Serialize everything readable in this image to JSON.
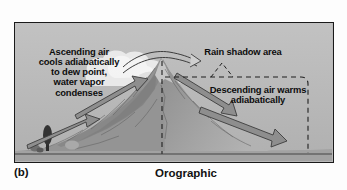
{
  "figure": {
    "panel_letter": "(b)",
    "caption": "Orographic",
    "diagram_type": "orographic precipitation cross-section",
    "background_color": "#b9b9b9",
    "border_color": "#1a1a1a"
  },
  "labels": {
    "ascending": "Ascending air\ncools adiabatically\nto dew point,\nwater vapor\ncondenses",
    "rain_shadow": "Rain shadow area",
    "descending": "Descending air warms\nadiabatically"
  },
  "elements": {
    "mountain_name": "mountain-cross-section",
    "cloud_name": "cloud",
    "tree_name": "tree",
    "bush_name": "bush",
    "windward_arrow_lower": "ascending-air-arrow-lower",
    "windward_arrow_upper": "ascending-air-arrow-upper",
    "summit_arrow": "summit-airflow-arrow",
    "leeward_arrow_upper": "descending-air-arrow-upper",
    "leeward_arrow_lower": "descending-air-arrow-lower",
    "peak_dashed_line": "summit-vertical-dashed-line",
    "rain_shadow_boundary": "rain-shadow-dashed-boundary",
    "rain_shadow_leader": "rain-shadow-leader-line",
    "ground_line": "ground-line"
  },
  "colors": {
    "sky": "#b9b9b9",
    "mountain_light": "#bdbdbd",
    "mountain_mid": "#9a9a9a",
    "mountain_dark": "#848484",
    "arrow_fill": "#8c8c8c",
    "arrow_stroke": "#3b3b3b",
    "cloud": "#ececec",
    "outline": "#1a1a1a",
    "text": "#0d0d0d"
  }
}
